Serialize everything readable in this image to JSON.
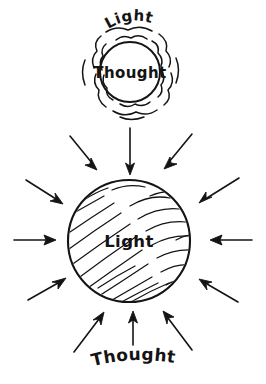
{
  "figure": {
    "kind": "hand-drawn-concept-diagram",
    "background_color": "#ffffff",
    "ink_color": "#141414",
    "width": 266,
    "height": 384
  },
  "top_unit": {
    "name": "thought-radiating-light",
    "core_label": "Thought",
    "aura_label": "Light",
    "core_circle": {
      "cx": 130,
      "cy": 72,
      "r": 30
    },
    "aura_description": "two concentric wavy scalloped rings surrounding the core circle",
    "aura_rings": 2
  },
  "bottom_unit": {
    "name": "light-receiving-thought",
    "core_label": "Light",
    "inbound_label": "Thought",
    "core_circle": {
      "cx": 129,
      "cy": 241,
      "r": 61
    },
    "fill_description": "diagonal hand-drawn hatching running lower-left to upper-right",
    "hatch_line_count": 22
  },
  "arrows": {
    "description": "eight arrows converging inward on the large Light circle, plus one vertical arrow descending from the top unit",
    "count_inbound": 8,
    "descending_arrow": {
      "from": [
        130,
        128
      ],
      "to": [
        130,
        172
      ],
      "direction": "down"
    },
    "inbound_list": [
      {
        "name": "arrow-top-left",
        "direction": "down-right"
      },
      {
        "name": "arrow-top-right",
        "direction": "down-left"
      },
      {
        "name": "arrow-upper-left",
        "direction": "down-right"
      },
      {
        "name": "arrow-upper-right",
        "direction": "down-left"
      },
      {
        "name": "arrow-left",
        "direction": "right"
      },
      {
        "name": "arrow-right",
        "direction": "left"
      },
      {
        "name": "arrow-lower-left",
        "direction": "up-right"
      },
      {
        "name": "arrow-lower-right",
        "direction": "up-left"
      },
      {
        "name": "arrow-bottom-left",
        "direction": "up-right"
      },
      {
        "name": "arrow-bottom-center",
        "direction": "up"
      },
      {
        "name": "arrow-bottom-right",
        "direction": "up-left"
      }
    ]
  },
  "labels": {
    "light_top": "Light",
    "thought_inner": "Thought",
    "light_main": "Light",
    "thought_bottom": "Thought"
  }
}
